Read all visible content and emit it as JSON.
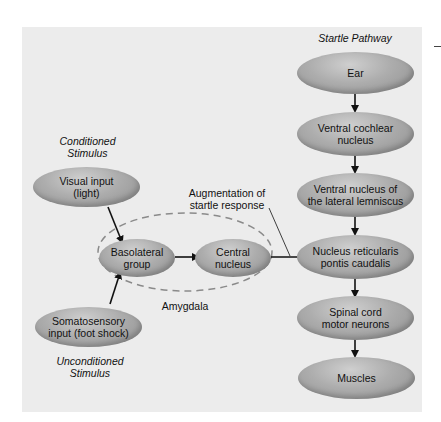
{
  "title": "Startle Pathway",
  "labels": {
    "conditioned": "Conditioned Stimulus",
    "conditioned_line1": "Conditioned",
    "conditioned_line2": "Stimulus",
    "unconditioned_line1": "Unconditioned",
    "unconditioned_line2": "Stimulus",
    "augmentation_line1": "Augmentation of",
    "augmentation_line2": "startle response",
    "amygdala": "Amygdala"
  },
  "nodes": {
    "ear": "Ear",
    "ventral_cochlear_1": "Ventral cochlear",
    "ventral_cochlear_2": "nucleus",
    "ventral_lemniscus_1": "Ventral nucleus of",
    "ventral_lemniscus_2": "the lateral lemniscus",
    "reticularis_1": "Nucleus reticularis",
    "reticularis_2": "pontis caudalis",
    "spinal_1": "Spinal cord",
    "spinal_2": "motor neurons",
    "muscles": "Muscles",
    "visual_1": "Visual input",
    "visual_2": "(light)",
    "basolateral_1": "Basolateral",
    "basolateral_2": "group",
    "central_1": "Central",
    "central_2": "nucleus",
    "somatosensory_1": "Somatosensory",
    "somatosensory_2": "input (foot shock)"
  },
  "colors": {
    "panel": "#ececec",
    "node": "#adadad",
    "arrow": "#111111",
    "dashed_outline": "#8a8a8a"
  }
}
